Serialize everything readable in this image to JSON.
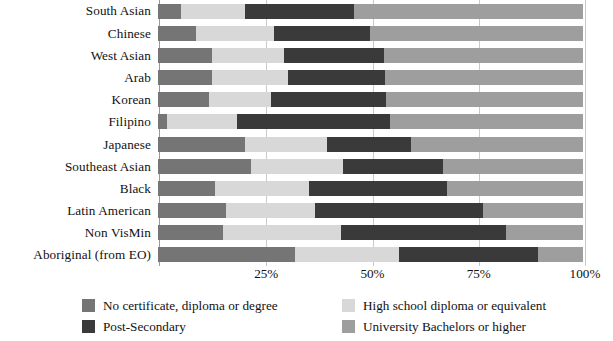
{
  "chart_data": {
    "type": "bar",
    "orientation": "horizontal",
    "stacked": true,
    "normalized": true,
    "title": "",
    "subtitle": "",
    "xlabel": "",
    "ylabel": "",
    "xlim": [
      0,
      100
    ],
    "xticks": [
      "25%",
      "50%",
      "75%",
      "100%"
    ],
    "xtick_values": [
      25,
      50,
      75,
      100
    ],
    "grid": true,
    "legend_position": "bottom",
    "categories": [
      "South Asian",
      "Chinese",
      "West Asian",
      "Arab",
      "Korean",
      "Filipino",
      "Japanese",
      "Southeast Asian",
      "Black",
      "Latin American",
      "Non VisMin",
      "Aboriginal (from EO)"
    ],
    "series": [
      {
        "name": "No certificate, diploma or degree",
        "color": "#757575",
        "values": [
          5.5,
          9.0,
          12.8,
          12.8,
          11.9,
          2.2,
          20.4,
          21.8,
          13.3,
          16.0,
          15.3,
          32.2
        ]
      },
      {
        "name": "High school diploma or equivalent",
        "color": "#d8d8d8",
        "values": [
          15.0,
          18.3,
          16.8,
          17.8,
          14.8,
          16.4,
          19.4,
          21.7,
          22.2,
          20.9,
          27.7,
          24.4
        ]
      },
      {
        "name": "Post-Secondary",
        "color": "#3a3a3a",
        "values": [
          25.5,
          22.7,
          23.6,
          22.9,
          26.9,
          35.9,
          19.8,
          23.5,
          32.5,
          39.6,
          39.0,
          32.8
        ]
      },
      {
        "name": "University Bachelors or higher",
        "color": "#9e9e9e",
        "values": [
          54.0,
          50.0,
          46.8,
          46.5,
          46.4,
          45.5,
          40.4,
          33.0,
          32.0,
          23.5,
          18.0,
          10.6
        ]
      }
    ]
  },
  "axis": {
    "ticks": [
      {
        "label": "25%",
        "pos": 25
      },
      {
        "label": "50%",
        "pos": 50
      },
      {
        "label": "75%",
        "pos": 75
      },
      {
        "label": "100%",
        "pos": 100
      }
    ]
  },
  "legend": {
    "entries": [
      {
        "label": "No certificate, diploma or degree",
        "color": "#757575"
      },
      {
        "label": "High school diploma or equivalent",
        "color": "#d8d8d8"
      },
      {
        "label": "Post-Secondary",
        "color": "#3a3a3a"
      },
      {
        "label": "University Bachelors or higher",
        "color": "#9e9e9e"
      }
    ]
  },
  "colors": {
    "background": "#ffffff",
    "text": "#111111",
    "gridline": "#c9c9c9",
    "axis": "#9a9a9a"
  }
}
